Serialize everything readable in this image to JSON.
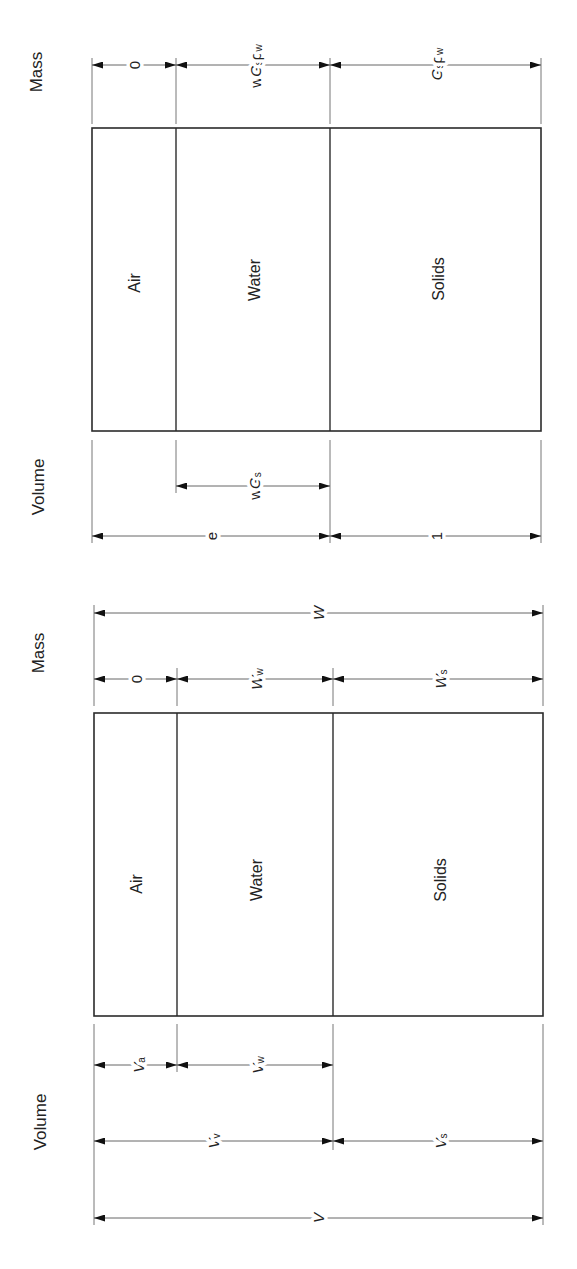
{
  "diagrams": [
    {
      "name": "normalized-phase-diagram",
      "mass_title": "Mass",
      "volume_title": "Volume",
      "phases": [
        "Air",
        "Water",
        "Solids"
      ],
      "mass_dims": [
        {
          "text": "0",
          "parts": [
            "0"
          ]
        },
        {
          "text": "wGsρw",
          "parts": [
            "w",
            "G",
            "s",
            "ρ",
            "w"
          ]
        },
        {
          "text": "Gsρw",
          "parts": [
            "G",
            "s",
            "ρ",
            "w"
          ]
        }
      ],
      "volume_dims": [
        {
          "text": "wGs",
          "parts": [
            "w",
            "G",
            "s"
          ]
        },
        {
          "text": "e",
          "parts": [
            "e"
          ]
        },
        {
          "text": "1",
          "parts": [
            "1"
          ]
        }
      ]
    },
    {
      "name": "general-phase-diagram",
      "mass_title": "Mass",
      "volume_title": "Volume",
      "phases": [
        "Air",
        "Water",
        "Solids"
      ],
      "mass_dims": [
        {
          "text": "W",
          "parts": [
            "W"
          ]
        },
        {
          "text": "0",
          "parts": [
            "0"
          ]
        },
        {
          "text": "Ww",
          "parts": [
            "W",
            "w"
          ]
        },
        {
          "text": "Ws",
          "parts": [
            "W",
            "s"
          ]
        }
      ],
      "volume_dims": [
        {
          "text": "Va",
          "parts": [
            "V",
            "a"
          ]
        },
        {
          "text": "Vw",
          "parts": [
            "V",
            "w"
          ]
        },
        {
          "text": "Vv",
          "parts": [
            "V",
            "v"
          ]
        },
        {
          "text": "Vs",
          "parts": [
            "V",
            "s"
          ]
        },
        {
          "text": "V",
          "parts": [
            "V"
          ]
        }
      ]
    }
  ],
  "colors": {
    "line": "#2b2b2b",
    "background": "#ffffff",
    "text": "#222222"
  }
}
